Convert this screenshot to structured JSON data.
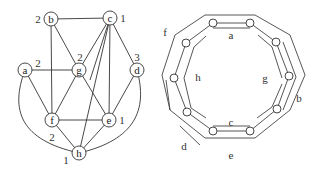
{
  "left_graph": {
    "nodes": [
      {
        "id": "b",
        "label": "b",
        "weight": "2"
      },
      {
        "id": "c",
        "label": "c",
        "weight": "1"
      },
      {
        "id": "a",
        "label": "a",
        "weight": "2"
      },
      {
        "id": "g",
        "label": "g",
        "weight": "2"
      },
      {
        "id": "d",
        "label": "d",
        "weight": "3"
      },
      {
        "id": "f",
        "label": "f",
        "weight": "2"
      },
      {
        "id": "e",
        "label": "e",
        "weight": "1"
      },
      {
        "id": "h",
        "label": "h",
        "weight": "1"
      }
    ],
    "edges": [
      [
        "b",
        "c"
      ],
      [
        "b",
        "g"
      ],
      [
        "b",
        "f"
      ],
      [
        "c",
        "g"
      ],
      [
        "c",
        "d"
      ],
      [
        "c",
        "e"
      ],
      [
        "c",
        "h"
      ],
      [
        "c",
        "f"
      ],
      [
        "a",
        "g"
      ],
      [
        "a",
        "f"
      ],
      [
        "a",
        "h"
      ],
      [
        "g",
        "f"
      ],
      [
        "g",
        "e"
      ],
      [
        "d",
        "e"
      ],
      [
        "d",
        "h"
      ],
      [
        "f",
        "e"
      ],
      [
        "f",
        "h"
      ],
      [
        "e",
        "h"
      ]
    ]
  },
  "right_diagram": {
    "segment_labels": {
      "a": "a",
      "b": "b",
      "c": "c",
      "d": "d",
      "e": "e",
      "f": "f",
      "g": "g",
      "h": "h"
    },
    "node_count": 10
  }
}
